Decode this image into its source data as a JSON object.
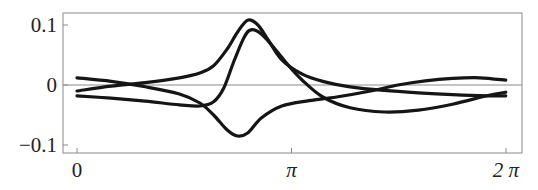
{
  "chart_data": {
    "type": "line",
    "title": "",
    "xlabel": "",
    "ylabel": "",
    "xlim": [
      -0.2,
      6.5
    ],
    "ylim": [
      -0.112,
      0.12
    ],
    "grid": false,
    "legend": null,
    "x_ticks": [
      {
        "value": 0,
        "label": "0"
      },
      {
        "value": 3.14159,
        "label": "π"
      },
      {
        "value": 6.28318,
        "label": "2 π"
      }
    ],
    "y_ticks": [
      {
        "value": 0.1,
        "label": "0.1"
      },
      {
        "value": 0,
        "label": "0"
      },
      {
        "value": -0.1,
        "label": "−0.1"
      }
    ],
    "reference_line": {
      "y": 0
    },
    "series": [
      {
        "name": "curve-1",
        "x": [
          0,
          0.5,
          1.0,
          1.5,
          1.8,
          2.0,
          2.2,
          2.35,
          2.5,
          2.65,
          2.8,
          3.0,
          3.3,
          3.6,
          4.0,
          4.5,
          5.0,
          5.5,
          6.0,
          6.28
        ],
        "values": [
          -0.01,
          -0.002,
          0.004,
          0.012,
          0.02,
          0.032,
          0.06,
          0.088,
          0.108,
          0.1,
          0.075,
          0.042,
          0.018,
          0.006,
          -0.003,
          -0.009,
          -0.013,
          -0.016,
          -0.018,
          -0.018
        ]
      },
      {
        "name": "curve-2",
        "x": [
          0,
          0.5,
          1.0,
          1.5,
          1.8,
          2.0,
          2.15,
          2.3,
          2.45,
          2.55,
          2.7,
          2.9,
          3.1,
          3.3,
          3.6,
          4.0,
          4.5,
          5.0,
          5.5,
          6.0,
          6.28
        ],
        "values": [
          -0.018,
          -0.022,
          -0.027,
          -0.033,
          -0.035,
          -0.028,
          -0.005,
          0.04,
          0.08,
          0.092,
          0.085,
          0.06,
          0.032,
          0.008,
          -0.02,
          -0.038,
          -0.045,
          -0.042,
          -0.032,
          -0.018,
          -0.012
        ]
      },
      {
        "name": "curve-3",
        "x": [
          0,
          0.5,
          1.0,
          1.5,
          1.8,
          2.0,
          2.2,
          2.35,
          2.5,
          2.7,
          3.0,
          3.4,
          3.8,
          4.3,
          4.7,
          5.1,
          5.5,
          5.9,
          6.28
        ],
        "values": [
          0.012,
          0.006,
          -0.003,
          -0.015,
          -0.03,
          -0.05,
          -0.075,
          -0.085,
          -0.08,
          -0.055,
          -0.035,
          -0.026,
          -0.02,
          -0.01,
          0.0,
          0.007,
          0.011,
          0.012,
          0.008
        ]
      }
    ]
  }
}
